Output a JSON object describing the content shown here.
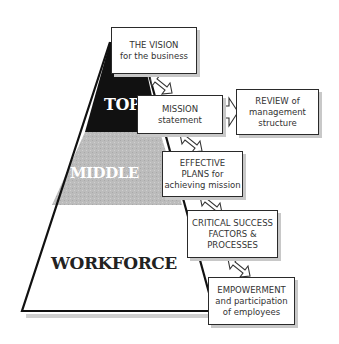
{
  "pyramid": {
    "tiers": [
      {
        "label": "TOP",
        "fill": "#111111"
      },
      {
        "label": "MIDDLE",
        "fill": "#bdbdbd"
      },
      {
        "label": "WORKFORCE",
        "fill": "#ffffff"
      }
    ]
  },
  "boxes": {
    "vision": {
      "line1": "THE VISION",
      "line2": "for the business"
    },
    "mission": {
      "line1": "MISSION",
      "line2": "statement"
    },
    "review": {
      "line1": "REVIEW of",
      "line2": "management",
      "line3": "structure"
    },
    "plans": {
      "line1": "EFFECTIVE",
      "line2": "PLANS for",
      "line3": "achieving mission"
    },
    "csf": {
      "line1": "CRITICAL SUCCESS",
      "line2": "FACTORS &",
      "line3": "PROCESSES"
    },
    "empowerment": {
      "line1": "EMPOWERMENT",
      "line2": "and participation",
      "line3": "of employees"
    }
  },
  "arrows": [
    {
      "from": "vision",
      "to": "mission",
      "type": "two-way"
    },
    {
      "from": "mission",
      "to": "review",
      "type": "one-way"
    },
    {
      "from": "mission",
      "to": "plans",
      "type": "two-way"
    },
    {
      "from": "plans",
      "to": "csf",
      "type": "two-way"
    },
    {
      "from": "csf",
      "to": "empowerment",
      "type": "two-way"
    }
  ]
}
